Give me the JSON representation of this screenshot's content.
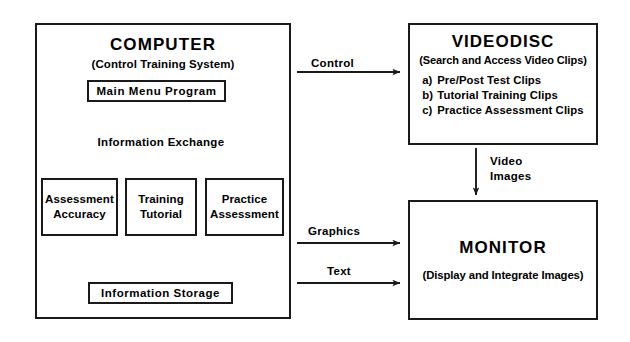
{
  "diagram": {
    "stroke_color": "#1a1a1a",
    "background_color": "#ffffff"
  },
  "computer": {
    "title": "COMPUTER",
    "subtitle": "(Control Training System)",
    "main_menu": "Main Menu Program",
    "information_exchange": "Information Exchange",
    "modules": [
      {
        "line1": "Assessment",
        "line2": "Accuracy"
      },
      {
        "line1": "Training",
        "line2": "Tutorial"
      },
      {
        "line1": "Practice",
        "line2": "Assessment"
      }
    ],
    "information_storage": "Information Storage"
  },
  "videodisc": {
    "title": "VIDEODISC",
    "subtitle": "(Search and Access Video Clips)",
    "items": [
      {
        "marker": "a)",
        "text": "Pre/Post Test Clips"
      },
      {
        "marker": "b)",
        "text": "Tutorial Training Clips"
      },
      {
        "marker": "c)",
        "text": "Practice Assessment Clips"
      }
    ]
  },
  "monitor": {
    "title": "MONITOR",
    "subtitle": "(Display and Integrate Images)"
  },
  "connections": {
    "control": "Control",
    "video_images_line1": "Video",
    "video_images_line2": "Images",
    "graphics": "Graphics",
    "text": "Text"
  }
}
